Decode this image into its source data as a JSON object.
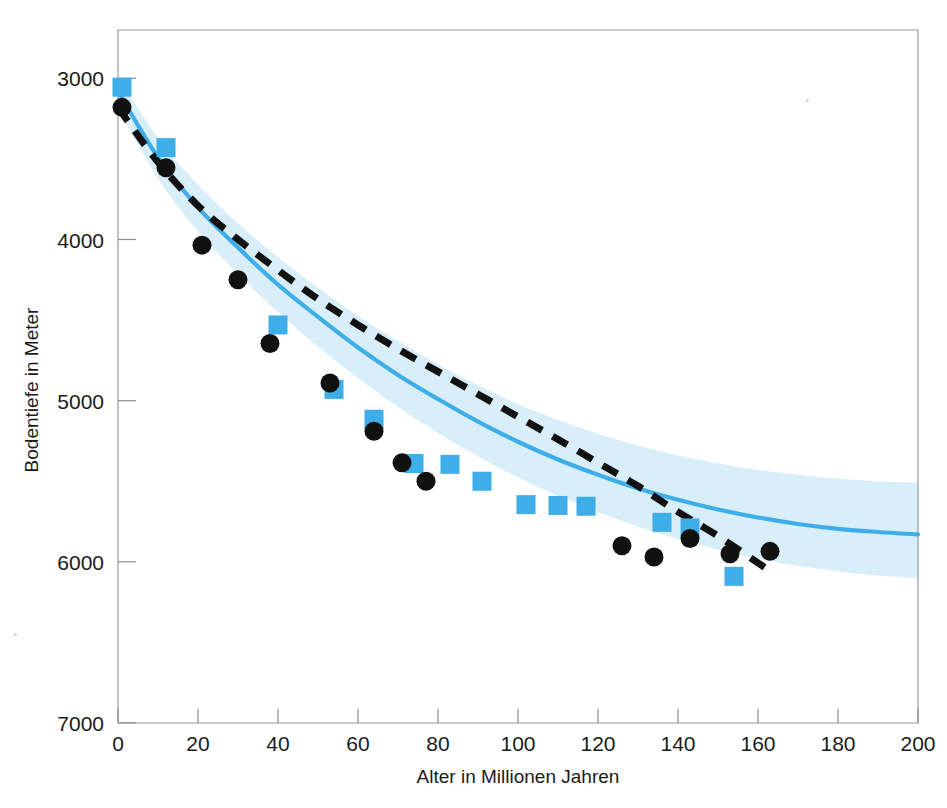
{
  "chart_data": {
    "type": "scatter",
    "title": "",
    "subtitle": "",
    "xlabel": "Alter in Millionen Jahren",
    "ylabel": "Bodentiefe in Meter",
    "xlim": [
      0,
      200
    ],
    "ylim": [
      7000,
      2700
    ],
    "y_inverted": true,
    "grid": false,
    "legend_position": "none",
    "xticks": [
      0,
      20,
      40,
      60,
      80,
      100,
      120,
      140,
      160,
      180,
      200
    ],
    "yticks": [
      3000,
      4000,
      5000,
      6000,
      7000
    ],
    "xtick_labels": [
      "0",
      "20",
      "40",
      "60",
      "80",
      "100",
      "120",
      "140",
      "160",
      "180",
      "200"
    ],
    "ytick_labels": [
      "3000",
      "4000",
      "5000",
      "6000",
      "7000"
    ],
    "colors": {
      "accent_blue": "#3FAEE8",
      "band_blue": "#D8EEF8",
      "marker_black": "#111111",
      "frame_gray": "#9a9a9a",
      "text_black": "#1a1a1a"
    },
    "series": [
      {
        "name": "Messpunkte (schwarze Kreise)",
        "marker": "circle",
        "color": "#111111",
        "points": [
          {
            "x": 1,
            "y": 3180
          },
          {
            "x": 12,
            "y": 3555
          },
          {
            "x": 21,
            "y": 4035
          },
          {
            "x": 30,
            "y": 4250
          },
          {
            "x": 38,
            "y": 4645
          },
          {
            "x": 53,
            "y": 4890
          },
          {
            "x": 64,
            "y": 5190
          },
          {
            "x": 71,
            "y": 5385
          },
          {
            "x": 77,
            "y": 5500
          },
          {
            "x": 126,
            "y": 5900
          },
          {
            "x": 134,
            "y": 5970
          },
          {
            "x": 143,
            "y": 5855
          },
          {
            "x": 153,
            "y": 5950
          },
          {
            "x": 163,
            "y": 5935
          }
        ]
      },
      {
        "name": "Modellpunkte (blaue Quadrate)",
        "marker": "square",
        "color": "#3FAEE8",
        "points": [
          {
            "x": 1,
            "y": 3055
          },
          {
            "x": 12,
            "y": 3430
          },
          {
            "x": 40,
            "y": 4530
          },
          {
            "x": 54,
            "y": 4930
          },
          {
            "x": 64,
            "y": 5115
          },
          {
            "x": 74,
            "y": 5390
          },
          {
            "x": 83,
            "y": 5395
          },
          {
            "x": 91,
            "y": 5500
          },
          {
            "x": 102,
            "y": 5645
          },
          {
            "x": 110,
            "y": 5650
          },
          {
            "x": 117,
            "y": 5655
          },
          {
            "x": 136,
            "y": 5755
          },
          {
            "x": 143,
            "y": 5790
          },
          {
            "x": 154,
            "y": 6090
          }
        ]
      }
    ],
    "curves": [
      {
        "name": "Halbraum-Modell (gestrichelt schwarz)",
        "style": "dashed",
        "color": "#111111",
        "formula_note": "Wurzel-t Abkuehlung",
        "points": [
          {
            "x": 0,
            "y": 3180
          },
          {
            "x": 10,
            "y": 3520
          },
          {
            "x": 20,
            "y": 3790
          },
          {
            "x": 30,
            "y": 4000
          },
          {
            "x": 40,
            "y": 4190
          },
          {
            "x": 50,
            "y": 4370
          },
          {
            "x": 60,
            "y": 4530
          },
          {
            "x": 70,
            "y": 4680
          },
          {
            "x": 80,
            "y": 4820
          },
          {
            "x": 90,
            "y": 4960
          },
          {
            "x": 100,
            "y": 5100
          },
          {
            "x": 110,
            "y": 5240
          },
          {
            "x": 120,
            "y": 5385
          },
          {
            "x": 130,
            "y": 5530
          },
          {
            "x": 140,
            "y": 5690
          },
          {
            "x": 150,
            "y": 5840
          },
          {
            "x": 162,
            "y": 6040
          }
        ]
      },
      {
        "name": "Plattenmodell (blaue Linie)",
        "style": "solid",
        "color": "#3FAEE8",
        "points": [
          {
            "x": 0,
            "y": 3080
          },
          {
            "x": 10,
            "y": 3490
          },
          {
            "x": 20,
            "y": 3800
          },
          {
            "x": 30,
            "y": 4050
          },
          {
            "x": 40,
            "y": 4280
          },
          {
            "x": 50,
            "y": 4480
          },
          {
            "x": 60,
            "y": 4670
          },
          {
            "x": 70,
            "y": 4840
          },
          {
            "x": 80,
            "y": 4990
          },
          {
            "x": 90,
            "y": 5130
          },
          {
            "x": 100,
            "y": 5255
          },
          {
            "x": 110,
            "y": 5365
          },
          {
            "x": 120,
            "y": 5460
          },
          {
            "x": 130,
            "y": 5545
          },
          {
            "x": 140,
            "y": 5615
          },
          {
            "x": 150,
            "y": 5675
          },
          {
            "x": 160,
            "y": 5725
          },
          {
            "x": 170,
            "y": 5765
          },
          {
            "x": 180,
            "y": 5795
          },
          {
            "x": 190,
            "y": 5815
          },
          {
            "x": 200,
            "y": 5830
          }
        ]
      }
    ],
    "band": {
      "name": "Unsicherheitsband",
      "color": "#D8EEF8",
      "upper": [
        {
          "x": 0,
          "y": 2990
        },
        {
          "x": 10,
          "y": 3370
        },
        {
          "x": 20,
          "y": 3660
        },
        {
          "x": 30,
          "y": 3900
        },
        {
          "x": 40,
          "y": 4110
        },
        {
          "x": 50,
          "y": 4300
        },
        {
          "x": 60,
          "y": 4475
        },
        {
          "x": 70,
          "y": 4630
        },
        {
          "x": 80,
          "y": 4775
        },
        {
          "x": 90,
          "y": 4905
        },
        {
          "x": 100,
          "y": 5020
        },
        {
          "x": 110,
          "y": 5120
        },
        {
          "x": 120,
          "y": 5205
        },
        {
          "x": 130,
          "y": 5280
        },
        {
          "x": 140,
          "y": 5340
        },
        {
          "x": 150,
          "y": 5390
        },
        {
          "x": 160,
          "y": 5430
        },
        {
          "x": 170,
          "y": 5460
        },
        {
          "x": 180,
          "y": 5485
        },
        {
          "x": 190,
          "y": 5500
        },
        {
          "x": 200,
          "y": 5510
        }
      ],
      "lower": [
        {
          "x": 0,
          "y": 3180
        },
        {
          "x": 10,
          "y": 3620
        },
        {
          "x": 20,
          "y": 3950
        },
        {
          "x": 30,
          "y": 4215
        },
        {
          "x": 40,
          "y": 4450
        },
        {
          "x": 50,
          "y": 4665
        },
        {
          "x": 60,
          "y": 4860
        },
        {
          "x": 70,
          "y": 5040
        },
        {
          "x": 80,
          "y": 5200
        },
        {
          "x": 90,
          "y": 5345
        },
        {
          "x": 100,
          "y": 5475
        },
        {
          "x": 110,
          "y": 5590
        },
        {
          "x": 120,
          "y": 5690
        },
        {
          "x": 130,
          "y": 5780
        },
        {
          "x": 140,
          "y": 5860
        },
        {
          "x": 150,
          "y": 5925
        },
        {
          "x": 160,
          "y": 5980
        },
        {
          "x": 170,
          "y": 6025
        },
        {
          "x": 180,
          "y": 6060
        },
        {
          "x": 190,
          "y": 6085
        },
        {
          "x": 200,
          "y": 6100
        }
      ]
    }
  },
  "plot_geometry": {
    "left": 118,
    "right": 918,
    "top": 30,
    "bottom": 723
  }
}
